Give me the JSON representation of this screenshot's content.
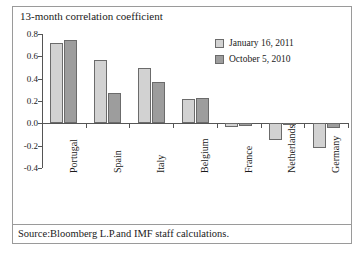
{
  "chart_data": {
    "type": "bar",
    "title": "13-month correlation coefficient",
    "xlabel": "",
    "ylabel": "",
    "ylim": [
      -0.4,
      0.8
    ],
    "ytick_labels": [
      "0.8",
      "0.6",
      "0.4",
      "0.2",
      "0.0",
      "-0.2",
      "-0.4"
    ],
    "ytick_values": [
      0.8,
      0.6,
      0.4,
      0.2,
      0.0,
      -0.2,
      -0.4
    ],
    "grid": false,
    "legend_position": "upper-right",
    "categories": [
      "Portugal",
      "Spain",
      "Italy",
      "Belgium",
      "France",
      "Netherlands",
      "Germany"
    ],
    "series": [
      {
        "name": "January 16, 2011",
        "color": "#d2d2d2",
        "values": [
          0.72,
          0.57,
          0.5,
          0.22,
          -0.03,
          -0.15,
          -0.22
        ]
      },
      {
        "name": "October 5, 2010",
        "color": "#9d9d9d",
        "values": [
          0.75,
          0.27,
          0.37,
          0.23,
          -0.02,
          -0.01,
          -0.04
        ]
      }
    ]
  },
  "source": {
    "text": "Source:Bloomberg L.P.and IMF staff calculations."
  }
}
